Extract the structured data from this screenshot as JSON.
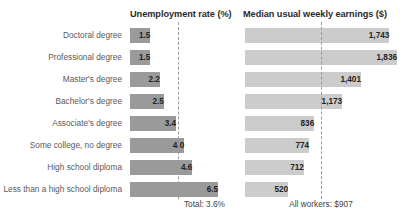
{
  "chart_data": {
    "type": "bar",
    "title": "",
    "orientation": "horizontal",
    "categories": [
      "Doctoral degree",
      "Professional degree",
      "Master's degree",
      "Bachelor's degree",
      "Associate's degree",
      "Some college, no degree",
      "High school diploma",
      "Less than a high school diploma"
    ],
    "panels": [
      {
        "id": "unemployment",
        "title": "Unemployment rate (%)",
        "xlabel": "",
        "ylabel": "",
        "xlim": [
          0,
          7
        ],
        "grid": false,
        "bar_color": "#9a9a9a",
        "values": [
          1.5,
          1.5,
          2.2,
          2.5,
          3.4,
          4.0,
          4.6,
          6.5
        ],
        "value_labels": [
          "1.5",
          "1.5",
          "2.2",
          "2.5",
          "3.4",
          "4.0",
          "4.6",
          "6.5"
        ],
        "reference_line": {
          "value": 3.6,
          "label": "Total: 3.6%",
          "style": "dashed"
        }
      },
      {
        "id": "earnings",
        "title": "Median usual weekly earnings ($)",
        "xlabel": "",
        "ylabel": "",
        "xlim": [
          0,
          1900
        ],
        "grid": false,
        "bar_color": "#cccccc",
        "values": [
          1743,
          1836,
          1401,
          1173,
          836,
          774,
          712,
          520
        ],
        "value_labels": [
          "1,743",
          "1,836",
          "1,401",
          "1,173",
          "836",
          "774",
          "712",
          "520"
        ],
        "reference_line": {
          "value": 907,
          "label": "All workers: $907",
          "style": "dashed"
        }
      }
    ],
    "legend": null,
    "legend_position": "none"
  },
  "colors": {
    "unemployment_bar": "#9a9a9a",
    "earnings_bar": "#cccccc",
    "reference_line": "#9b9b9b",
    "label_text": "#5a5a5a",
    "title_text": "#2b2b2b",
    "background": "#ffffff"
  }
}
